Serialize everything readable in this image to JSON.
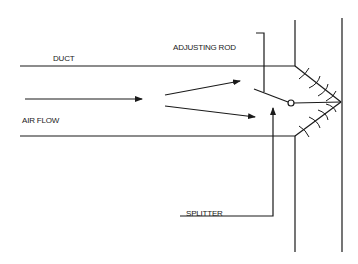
{
  "diagram": {
    "labels": {
      "duct": "DUCT",
      "adjusting_rod": "ADJUSTING ROD",
      "air_flow": "AIR FLOW",
      "splitter": "SPLITTER"
    },
    "colors": {
      "line": "#1a1a1a",
      "background": "#ffffff"
    }
  }
}
